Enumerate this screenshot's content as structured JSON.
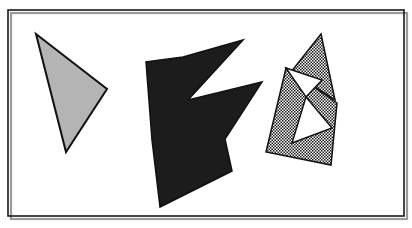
{
  "figure": {
    "canvas": {
      "width": 412,
      "height": 228,
      "background": "#ffffff"
    },
    "frame": {
      "name": "border-rectangle",
      "x": 8,
      "y": 10,
      "width": 396,
      "height": 206,
      "stroke": "#1a1a1a",
      "stroke_width": 1.6,
      "fill": "none",
      "shadow_color": "#9a9a9a"
    },
    "palette": {
      "outline": "#111111",
      "light_gray_fill": "#b4b4b4",
      "black_fill": "#1c1c1c",
      "stipple_dot": "#1a1a1a",
      "stipple_background": "#ffffff",
      "page_background": "#ffffff"
    },
    "shapes": [
      {
        "id": "shape-1",
        "name": "light-gray-triangle",
        "kind": "triangle",
        "fill_style": "solid-light-gray",
        "fill": "#b4b4b4",
        "stroke": "#111111",
        "stroke_width": 2,
        "points": "36,34 107,89 66,152",
        "vertex_count": 3,
        "vertices": [
          {
            "x": 36,
            "y": 34
          },
          {
            "x": 107,
            "y": 89
          },
          {
            "x": 66,
            "y": 152
          }
        ]
      },
      {
        "id": "shape-2",
        "name": "black-arrow-polygon",
        "kind": "concave-polygon",
        "fill_style": "solid-black",
        "fill": "#1c1c1c",
        "stroke": "#111111",
        "stroke_width": 1.5,
        "points": "243,40 188,100 262,82 225,139 232,171 160,207 152,140 146,62 183,57",
        "vertex_count": 9,
        "vertices": [
          {
            "x": 243,
            "y": 40
          },
          {
            "x": 188,
            "y": 100
          },
          {
            "x": 262,
            "y": 82
          },
          {
            "x": 225,
            "y": 139
          },
          {
            "x": 232,
            "y": 171
          },
          {
            "x": 160,
            "y": 207
          },
          {
            "x": 152,
            "y": 140
          },
          {
            "x": 146,
            "y": 62
          },
          {
            "x": 183,
            "y": 57
          }
        ]
      },
      {
        "id": "shape-3a",
        "name": "stippled-upper-quadrilateral",
        "kind": "quadrilateral",
        "fill_style": "stipple-dotted",
        "fill": "url(#stipple)",
        "stroke": "#111111",
        "stroke_width": 1.5,
        "points": "321,34 335,100 286,68 291,72",
        "vertex_count": 4,
        "vertices": [
          {
            "x": 321,
            "y": 34
          },
          {
            "x": 335,
            "y": 100
          },
          {
            "x": 286,
            "y": 68
          },
          {
            "x": 291,
            "y": 72
          }
        ]
      },
      {
        "id": "shape-3b",
        "name": "stippled-lower-quadrilateral",
        "kind": "quadrilateral",
        "fill_style": "stipple-dotted",
        "fill": "url(#stipple)",
        "stroke": "#111111",
        "stroke_width": 1.5,
        "points": "286,68 337,103 331,165 266,152",
        "vertex_count": 4,
        "vertices": [
          {
            "x": 286,
            "y": 68
          },
          {
            "x": 337,
            "y": 103
          },
          {
            "x": 331,
            "y": 165
          },
          {
            "x": 266,
            "y": 152
          }
        ]
      },
      {
        "id": "shape-3c",
        "name": "white-upper-notch-triangle",
        "kind": "triangle",
        "fill_style": "solid-white",
        "fill": "#ffffff",
        "stroke": "#111111",
        "stroke_width": 1.4,
        "points": "286,68 322,80 306,97",
        "vertex_count": 3,
        "vertices": [
          {
            "x": 286,
            "y": 68
          },
          {
            "x": 322,
            "y": 80
          },
          {
            "x": 306,
            "y": 97
          }
        ]
      },
      {
        "id": "shape-3d",
        "name": "white-lower-notch-triangle",
        "kind": "triangle",
        "fill_style": "solid-white",
        "fill": "#ffffff",
        "stroke": "#111111",
        "stroke_width": 1.4,
        "points": "306,97 332,128 292,143",
        "vertex_count": 3,
        "vertices": [
          {
            "x": 306,
            "y": 97
          },
          {
            "x": 332,
            "y": 128
          },
          {
            "x": 292,
            "y": 143
          }
        ]
      }
    ]
  }
}
